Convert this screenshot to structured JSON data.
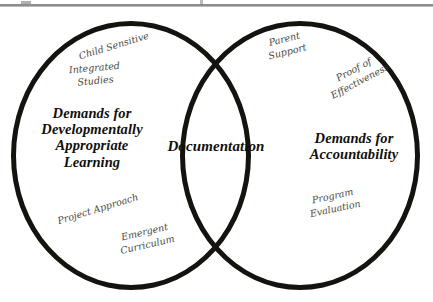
{
  "diagram": {
    "type": "venn",
    "colors": {
      "outline": "#14130f",
      "main_text": "#100f0c",
      "hand_text": "#3a3834",
      "background": "#ffffff",
      "rule": "#8d8d8d"
    },
    "sets": {
      "left": {
        "label": "Demands for\nDevelopmentally\nAppropriate\nLearning",
        "satellites": [
          {
            "text": "Child Sensitive"
          },
          {
            "text": "Integrated\nStudies"
          },
          {
            "text": "Project Approach"
          },
          {
            "text": "Emergent\nCurriculum"
          }
        ]
      },
      "right": {
        "label": "Demands for\nAccountability",
        "satellites": [
          {
            "text": "Parent\nSupport"
          },
          {
            "text": "Proof of\nEffectiveness"
          },
          {
            "text": "Program\nEvaluation"
          }
        ]
      },
      "intersection": {
        "label": "Documentation"
      }
    }
  }
}
